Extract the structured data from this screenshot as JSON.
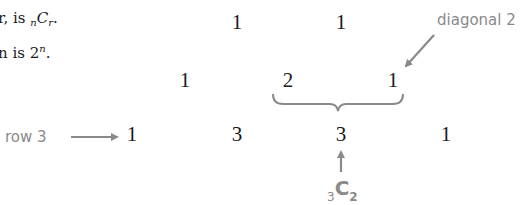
{
  "text": {
    "line1_prefix": "r, is ",
    "line1_sub_n": "n",
    "line1_C": "C",
    "line1_sub_r": "r",
    "line1_suffix": ".",
    "line2_prefix": "n is 2",
    "line2_sup": "n",
    "line2_suffix": "."
  },
  "triangle": {
    "row1": [
      "1",
      "1"
    ],
    "row2": [
      "1",
      "2",
      "1"
    ],
    "row3": [
      "1",
      "3",
      "3",
      "1"
    ]
  },
  "annotations": {
    "diagonal_label": "diagonal 2",
    "row_label": "row 3",
    "combination": {
      "pre_sub": "3",
      "letter": "C",
      "post_sub": "2"
    }
  },
  "colors": {
    "annotation": "#8a8a8a",
    "text": "#1a1a1a"
  }
}
